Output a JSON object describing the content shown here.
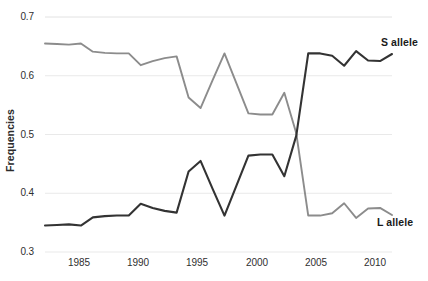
{
  "chart_data": {
    "type": "line",
    "title": "",
    "xlabel": "",
    "ylabel": "Frequencies",
    "xlim": [
      1983,
      2012
    ],
    "ylim": [
      0.3,
      0.7
    ],
    "grid": true,
    "legend_position": "inline-right",
    "x": [
      1983,
      1984,
      1985,
      1986,
      1987,
      1988,
      1989,
      1990,
      1991,
      1992,
      1993,
      1994,
      1995,
      1996,
      1997,
      1998,
      1999,
      2000,
      2001,
      2002,
      2003,
      2004,
      2005,
      2006,
      2007,
      2008,
      2009,
      2010,
      2011,
      2012
    ],
    "series": [
      {
        "name": "S allele",
        "color": "#8c8c8c",
        "values": [
          0.655,
          0.654,
          0.653,
          0.655,
          0.641,
          0.639,
          0.638,
          0.638,
          0.618,
          0.625,
          0.63,
          0.633,
          0.563,
          0.545,
          0.592,
          0.638,
          0.587,
          0.536,
          0.534,
          0.534,
          0.571,
          0.502,
          0.362,
          0.362,
          0.366,
          0.383,
          0.358,
          0.374,
          0.375,
          0.363
        ]
      },
      {
        "name": "L allele",
        "color": "#333333",
        "values": [
          0.345,
          0.346,
          0.347,
          0.345,
          0.359,
          0.361,
          0.362,
          0.362,
          0.382,
          0.375,
          0.37,
          0.367,
          0.437,
          0.455,
          0.408,
          0.362,
          0.413,
          0.464,
          0.466,
          0.466,
          0.429,
          0.498,
          0.638,
          0.638,
          0.634,
          0.617,
          0.642,
          0.626,
          0.625,
          0.637
        ]
      }
    ],
    "xticks": [
      1985,
      1990,
      1995,
      2000,
      2005,
      2010
    ],
    "xtick_labels": [
      "1985",
      "1990",
      "1995",
      "2000",
      "2005",
      "2010"
    ],
    "yticks": [
      0.3,
      0.4,
      0.5,
      0.6,
      0.7
    ],
    "ytick_labels": [
      "0.3",
      "0.4",
      "0.5",
      "0.6",
      "0.7"
    ],
    "annotations": [
      {
        "text": "S allele",
        "series": "S allele"
      },
      {
        "text": "L allele",
        "series": "L allele"
      }
    ]
  },
  "axis": {
    "ylabel": "Frequencies",
    "ytick_0": "0.3",
    "ytick_1": "0.4",
    "ytick_2": "0.5",
    "ytick_3": "0.6",
    "ytick_4": "0.7",
    "xtick_0": "1985",
    "xtick_1": "1990",
    "xtick_2": "1995",
    "xtick_3": "2000",
    "xtick_4": "2005",
    "xtick_5": "2010"
  },
  "labels": {
    "s_allele": "S allele",
    "l_allele": "L allele"
  },
  "colors": {
    "s_allele_line": "#8c8c8c",
    "l_allele_line": "#333333",
    "grid": "#e9e9e9",
    "text": "#2f2f2f",
    "background": "#ffffff"
  }
}
